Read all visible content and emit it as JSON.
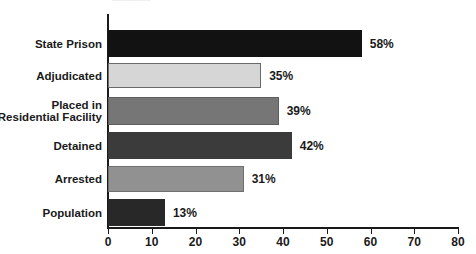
{
  "chart_data": {
    "type": "bar",
    "orientation": "horizontal",
    "title": "",
    "xlabel": "",
    "ylabel": "",
    "xlim": [
      0,
      80
    ],
    "xticks": [
      0,
      10,
      20,
      30,
      40,
      50,
      60,
      70,
      80
    ],
    "grid": false,
    "legend": "none",
    "value_suffix": "%",
    "categories": [
      "State Prison",
      "Adjudicated",
      "Placed in\nResidential Facility",
      "Detained",
      "Arrested",
      "Population"
    ],
    "values": [
      58,
      35,
      39,
      42,
      31,
      13
    ],
    "value_labels": [
      "58%",
      "35%",
      "39%",
      "42%",
      "31%",
      "13%"
    ],
    "bar_colors": [
      "#121212",
      "#d6d6d6",
      "#767676",
      "#3b3b3b",
      "#919191",
      "#282828"
    ],
    "bar_edge_colors": [
      "#121212",
      "#6a6a6a",
      "#5e5e5e",
      "#3b3b3b",
      "#6f6f6f",
      "#282828"
    ]
  },
  "axis": {
    "tick_labels": [
      "0",
      "10",
      "20",
      "30",
      "40",
      "50",
      "60",
      "70",
      "80"
    ]
  },
  "title_fragment": {
    "text": "••••••••••••"
  }
}
